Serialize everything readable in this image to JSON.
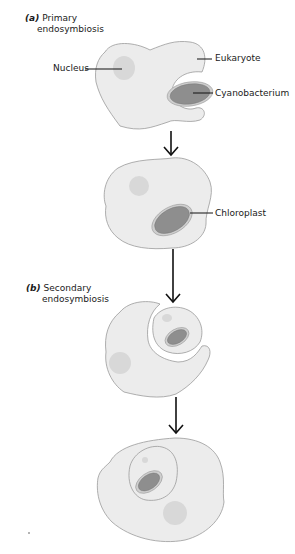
{
  "sections": {
    "a": {
      "letter": "(a)",
      "title_line1": "Primary",
      "title_line2": "endosymbiosis"
    },
    "b": {
      "letter": "(b)",
      "title_line1": "Secondary",
      "title_line2": "endosymbiosis"
    }
  },
  "labels": {
    "nucleus": "Nucleus",
    "eukaryote": "Eukaryote",
    "cyanobacterium": "Cyanobacterium",
    "chloroplast": "Chloroplast"
  },
  "colors": {
    "cell_fill": "#ececec",
    "cell_stroke": "#9a9a9a",
    "nucleus_fill": "#d6d6d6",
    "plastid_fill": "#8e8e8e",
    "plastid_ring": "#bdbdbd",
    "arrow": "#111111"
  }
}
